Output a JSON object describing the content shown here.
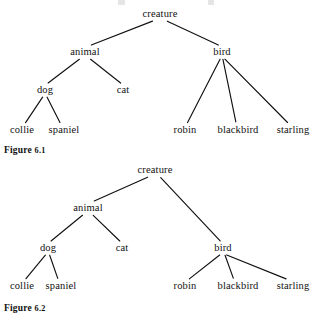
{
  "page": {
    "background_color": "#ffffff",
    "ink_color": "#111111",
    "bleed_marks": [
      {
        "left": 118,
        "width": 7
      },
      {
        "left": 208,
        "width": 6
      }
    ]
  },
  "figures": [
    {
      "id": "figure-1",
      "caption_prefix": "Figure",
      "caption_number": "6.1",
      "caption_x": 4,
      "caption_y": 146,
      "nodes": [
        {
          "key": "creature",
          "label": "creature",
          "x": 160,
          "y": 14
        },
        {
          "key": "animal",
          "label": "animal",
          "x": 85,
          "y": 52
        },
        {
          "key": "bird",
          "label": "bird",
          "x": 222,
          "y": 52
        },
        {
          "key": "dog",
          "label": "dog",
          "x": 45,
          "y": 90
        },
        {
          "key": "cat",
          "label": "cat",
          "x": 123,
          "y": 90
        },
        {
          "key": "collie",
          "label": "collie",
          "x": 22,
          "y": 130
        },
        {
          "key": "spaniel",
          "label": "spaniel",
          "x": 64,
          "y": 130
        },
        {
          "key": "robin",
          "label": "robin",
          "x": 185,
          "y": 130
        },
        {
          "key": "blackbird",
          "label": "blackbird",
          "x": 238,
          "y": 130
        },
        {
          "key": "starling",
          "label": "starling",
          "x": 293,
          "y": 130
        }
      ],
      "edges": [
        {
          "from": "creature",
          "to": "animal"
        },
        {
          "from": "creature",
          "to": "bird"
        },
        {
          "from": "animal",
          "to": "dog"
        },
        {
          "from": "animal",
          "to": "cat"
        },
        {
          "from": "dog",
          "to": "collie"
        },
        {
          "from": "dog",
          "to": "spaniel"
        },
        {
          "from": "bird",
          "to": "robin"
        },
        {
          "from": "bird",
          "to": "blackbird"
        },
        {
          "from": "bird",
          "to": "starling"
        }
      ]
    },
    {
      "id": "figure-2",
      "caption_prefix": "Figure",
      "caption_number": "6.2",
      "caption_x": 4,
      "caption_y": 146,
      "nodes": [
        {
          "key": "creature",
          "label": "creature",
          "x": 155,
          "y": 12
        },
        {
          "key": "animal",
          "label": "animal",
          "x": 88,
          "y": 50
        },
        {
          "key": "dog",
          "label": "dog",
          "x": 48,
          "y": 90
        },
        {
          "key": "cat",
          "label": "cat",
          "x": 122,
          "y": 90
        },
        {
          "key": "bird",
          "label": "bird",
          "x": 223,
          "y": 90
        },
        {
          "key": "collie",
          "label": "collie",
          "x": 22,
          "y": 128
        },
        {
          "key": "spaniel",
          "label": "spaniel",
          "x": 61,
          "y": 128
        },
        {
          "key": "robin",
          "label": "robin",
          "x": 185,
          "y": 128
        },
        {
          "key": "blackbird",
          "label": "blackbird",
          "x": 238,
          "y": 128
        },
        {
          "key": "starling",
          "label": "starling",
          "x": 293,
          "y": 128
        }
      ],
      "edges": [
        {
          "from": "creature",
          "to": "animal"
        },
        {
          "from": "creature",
          "to": "bird"
        },
        {
          "from": "animal",
          "to": "dog"
        },
        {
          "from": "animal",
          "to": "cat"
        },
        {
          "from": "dog",
          "to": "collie"
        },
        {
          "from": "dog",
          "to": "spaniel"
        },
        {
          "from": "bird",
          "to": "robin"
        },
        {
          "from": "bird",
          "to": "blackbird"
        },
        {
          "from": "bird",
          "to": "starling"
        }
      ]
    }
  ]
}
